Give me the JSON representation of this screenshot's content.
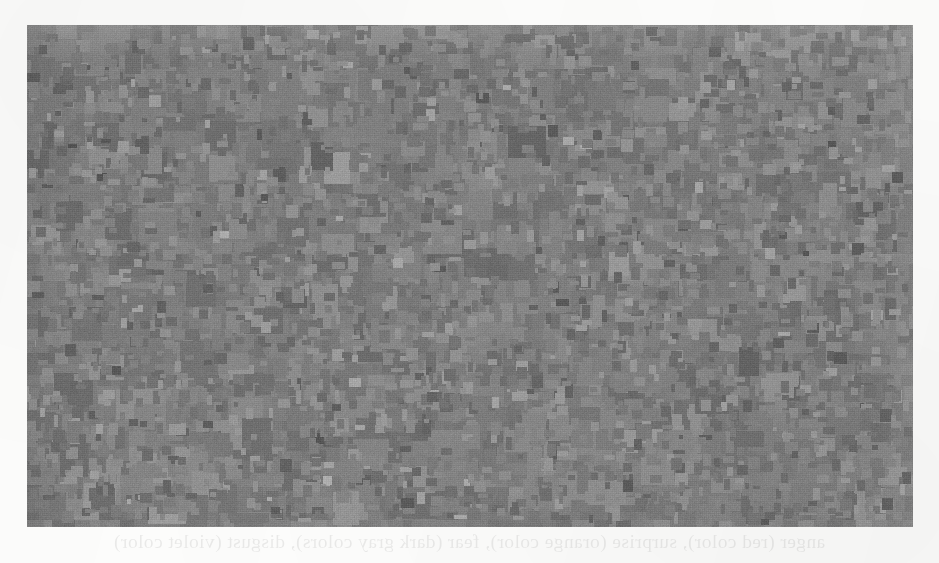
{
  "page": {
    "background_color": "#fdfdfc",
    "width": 939,
    "height": 563
  },
  "figure": {
    "name": "pixelated-grayscale-mosaic",
    "bounds": {
      "left": 27,
      "top": 25,
      "width": 886,
      "height": 502
    },
    "background_color": "#8a8a8a",
    "palette": {
      "darkest": "#434343",
      "dark": "#5c5c5c",
      "mid_dark": "#6e6e6e",
      "mid": "#808080",
      "mid_light": "#949494",
      "light": "#a6a6a6",
      "lightest": "#bcbcbc"
    },
    "block_size": {
      "min": 7,
      "max": 17,
      "typical": 11
    },
    "tone_range": {
      "min": 67,
      "max": 189,
      "mean": 128
    },
    "grain": "visible scanner noise and horizontal raster lines"
  },
  "showthrough": {
    "note": "faint mirrored text bleeding through from the reverse side of the page",
    "bottom_line": "anger (red color), surprise (orange color), fear (dark gray colors), disgust (violet color)",
    "top_line": ""
  }
}
